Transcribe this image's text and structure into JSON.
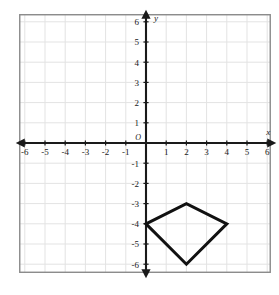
{
  "figure": {
    "kind": "coordinate-plane-with-polygon",
    "background_color": "#ffffff",
    "border_color": "#8a8a8a",
    "grid_color": "#e3e3e3",
    "axis_color": "#1a1a1a",
    "shape_color": "#111111"
  },
  "axes": {
    "x_label": "x",
    "y_label": "y",
    "origin_label": "O",
    "x_min": -6,
    "x_max": 6,
    "y_min": -6,
    "y_max": 6,
    "x_tick_labels": [
      "-6",
      "-5",
      "-4",
      "-3",
      "-2",
      "-1",
      "1",
      "2",
      "3",
      "4",
      "5",
      "6"
    ],
    "x_tick_values": [
      -6,
      -5,
      -4,
      -3,
      -2,
      -1,
      1,
      2,
      3,
      4,
      5,
      6
    ],
    "y_tick_labels": [
      "6",
      "5",
      "4",
      "3",
      "2",
      "1",
      "-1",
      "-2",
      "-3",
      "-4",
      "-5",
      "-6"
    ],
    "y_tick_values": [
      6,
      5,
      4,
      3,
      2,
      1,
      -1,
      -2,
      -3,
      -4,
      -5,
      -6
    ]
  },
  "chart_data": {
    "type": "scatter",
    "title": "",
    "xlabel": "x",
    "ylabel": "y",
    "xlim": [
      -6.6,
      6.6
    ],
    "ylim": [
      -6.6,
      6.6
    ],
    "grid": true,
    "legend": "none",
    "series": [
      {
        "name": "kite",
        "shape": "polygon",
        "closed": true,
        "points": [
          {
            "x": 0,
            "y": -4
          },
          {
            "x": 2,
            "y": -3
          },
          {
            "x": 4,
            "y": -4
          },
          {
            "x": 2,
            "y": -6
          }
        ]
      }
    ]
  }
}
